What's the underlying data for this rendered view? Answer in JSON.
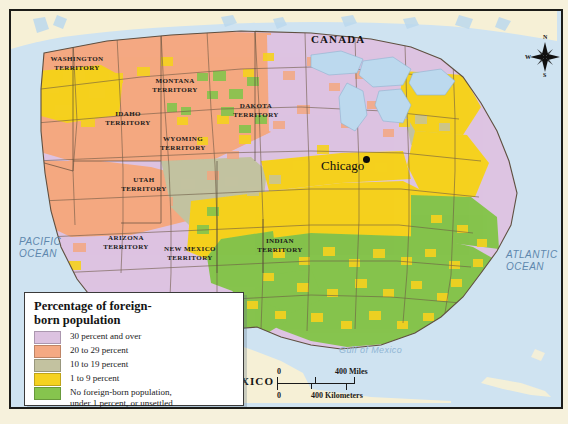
{
  "map": {
    "title_countries": [
      {
        "name": "CANADA",
        "x": 300,
        "y": 28
      },
      {
        "name": "MEXICO",
        "x": 210,
        "y": 371
      }
    ],
    "oceans": [
      {
        "name": "PACIFIC\nOCEAN",
        "x": 8,
        "y": 230
      },
      {
        "name": "ATLANTIC\nOCEAN",
        "x": 505,
        "y": 245
      }
    ],
    "gulf": {
      "name": "Gulf of Mexico",
      "x": 334,
      "y": 340
    },
    "city": {
      "name": "Chicago",
      "x": 317,
      "y": 155,
      "dot_x": 358,
      "dot_y": 153
    },
    "territories": [
      {
        "name": "WASHINGTON\nTERRITORY",
        "x": 37,
        "y": 49
      },
      {
        "name": "MONTANA\nTERRITORY",
        "x": 143,
        "y": 72
      },
      {
        "name": "IDAHO\nTERRITORY",
        "x": 98,
        "y": 105
      },
      {
        "name": "WYOMING\nTERRITORY",
        "x": 152,
        "y": 130
      },
      {
        "name": "DAKOTA\nTERRITORY",
        "x": 228,
        "y": 97
      },
      {
        "name": "UTAH\nTERRITORY",
        "x": 114,
        "y": 172
      },
      {
        "name": "ARIZONA\nTERRITORY",
        "x": 98,
        "y": 229
      },
      {
        "name": "NEW MEXICO\nTERRITORY",
        "x": 160,
        "y": 240
      },
      {
        "name": "INDIAN\nTERRITORY",
        "x": 251,
        "y": 232
      }
    ]
  },
  "legend": {
    "title": "Percentage of foreign-\nborn population",
    "items": [
      {
        "label": "30 percent and over",
        "color": "#dcc2e0"
      },
      {
        "label": "20 to 29 percent",
        "color": "#f4a983"
      },
      {
        "label": "10 to 19 percent",
        "color": "#c3c2a0"
      },
      {
        "label": "1 to 9 percent",
        "color": "#f5d220"
      },
      {
        "label": "No foreign-born population,\nunder 1 percent, or unsettled",
        "color": "#86c44e"
      }
    ]
  },
  "scale": {
    "miles_zero": "0",
    "miles_label": "400 Miles",
    "km_zero": "0",
    "km_label": "400 Kilometers"
  },
  "compass": {
    "north": "N",
    "south": "S",
    "east": "E",
    "west": "W"
  },
  "colors": {
    "ocean": "#cfe3f1",
    "land_foreign_land": "#f6f0d6",
    "border": "#1c1c18",
    "mat": "#f6f1dc"
  }
}
